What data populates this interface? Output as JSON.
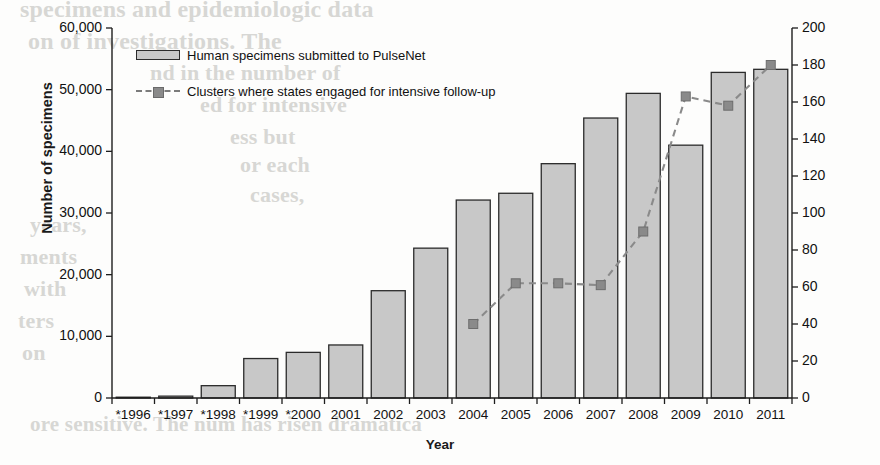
{
  "chart_data": {
    "type": "bar",
    "title": "",
    "xlabel": "Year",
    "ylabel": "Number of specimens",
    "ylabel_secondary": "Number of clusters",
    "categories": [
      "*1996",
      "*1997",
      "*1998",
      "*1999",
      "*2000",
      "2001",
      "2002",
      "2003",
      "2004",
      "2005",
      "2006",
      "2007",
      "2008",
      "2009",
      "2010",
      "2011"
    ],
    "ylim": [
      0,
      60000
    ],
    "ylim_secondary": [
      0,
      200
    ],
    "yticks": [
      "0",
      "10,000",
      "20,000",
      "30,000",
      "40,000",
      "50,000",
      "60,000"
    ],
    "yticks_secondary": [
      "0",
      "20",
      "40",
      "60",
      "80",
      "100",
      "120",
      "140",
      "160",
      "180",
      "200"
    ],
    "grid": false,
    "legend_position": "top-left",
    "series": [
      {
        "name": "Human specimens submitted to PulseNet",
        "type": "bar",
        "axis": "left",
        "color": "#c8c8c8",
        "edge_color": "#2b2b2b",
        "values": [
          100,
          300,
          2000,
          6400,
          7400,
          8600,
          17400,
          24300,
          32100,
          33200,
          38000,
          45400,
          49400,
          41000,
          52800,
          53300
        ]
      },
      {
        "name": "Clusters where states engaged for intensive follow-up",
        "type": "line",
        "axis": "right",
        "color": "#8a8a8a",
        "style": "dashed",
        "marker": "square",
        "values": [
          null,
          null,
          null,
          null,
          null,
          null,
          null,
          null,
          40,
          62,
          62,
          61,
          90,
          163,
          158,
          180
        ]
      }
    ]
  },
  "axes": {
    "left_title": "Number of specimens",
    "right_title": "Number of clusters",
    "x_title": "Year"
  },
  "legend": {
    "items": [
      {
        "label": "Human specimens submitted to PulseNet",
        "marker": "bar-swatch"
      },
      {
        "label": "Clusters where states engaged for intensive follow-up",
        "marker": "dashed-line-square-marker"
      }
    ]
  },
  "background_text": {
    "lines": [
      "specimens and epidemiologic data",
      "on of investigations. The",
      "nd in the number of",
      "ed for intensive",
      "ess but",
      "or each",
      "cases,",
      "years,",
      "ments",
      "with",
      "ters",
      "on",
      "ore sensitive. The num has risen dramatica"
    ]
  }
}
